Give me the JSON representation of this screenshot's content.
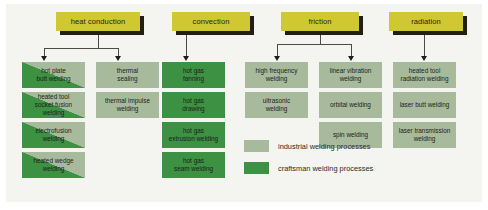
{
  "diagram": {
    "colors": {
      "header_yellow": "#cfc92f",
      "industrial_green": "#a7bb9c",
      "craftsman_green": "#3c9142",
      "connector": "#4a4a48",
      "shadow": "#231f14",
      "background": "#f4f4f1"
    },
    "headers": [
      {
        "id": "heat-conduction",
        "label": "heat conduction"
      },
      {
        "id": "convection",
        "label": "convection"
      },
      {
        "id": "friction",
        "label": "friction"
      },
      {
        "id": "radiation",
        "label": "radiation"
      }
    ],
    "columns": [
      {
        "id": "heat-conduction-col-1",
        "parent": "heat conduction",
        "items": [
          {
            "label": "hot plate\nbutt welding",
            "type": "both"
          },
          {
            "label": "heated tool\nsocket fusion welding",
            "type": "both"
          },
          {
            "label": "electrofusion\nwelding",
            "type": "both"
          },
          {
            "label": "heated wedge\nwelding",
            "type": "both"
          }
        ]
      },
      {
        "id": "heat-conduction-col-2",
        "parent": "heat conduction",
        "items": [
          {
            "label": "thermal\nsealing",
            "type": "industrial"
          },
          {
            "label": "thermal impulse\nwelding",
            "type": "industrial"
          }
        ]
      },
      {
        "id": "convection-col-1",
        "parent": "convection",
        "items": [
          {
            "label": "hot gas\nfanning",
            "type": "craftsman"
          },
          {
            "label": "hot gas\ndrawing",
            "type": "craftsman"
          },
          {
            "label": "hot gas\nextrusion welding",
            "type": "craftsman"
          },
          {
            "label": "hot gas\nseam welding",
            "type": "craftsman"
          }
        ]
      },
      {
        "id": "friction-col-1",
        "parent": "friction",
        "items": [
          {
            "label": "high frequency\nwelding",
            "type": "industrial"
          },
          {
            "label": "ultrasonic\nwelding",
            "type": "industrial"
          }
        ]
      },
      {
        "id": "friction-col-2",
        "parent": "friction",
        "items": [
          {
            "label": "linear vibration\nwelding",
            "type": "industrial"
          },
          {
            "label": "orbital welding",
            "type": "industrial"
          },
          {
            "label": "spin welding",
            "type": "industrial"
          }
        ]
      },
      {
        "id": "radiation-col-1",
        "parent": "radiation",
        "items": [
          {
            "label": "heated tool\nradiation welding",
            "type": "industrial"
          },
          {
            "label": "laser butt welding",
            "type": "industrial"
          },
          {
            "label": "laser transmission\nwelding",
            "type": "industrial"
          }
        ]
      }
    ],
    "legend": [
      {
        "swatch": "industrial",
        "label": "industrial welding processes"
      },
      {
        "swatch": "craftsman",
        "label": "craftsman welding processes"
      }
    ]
  }
}
